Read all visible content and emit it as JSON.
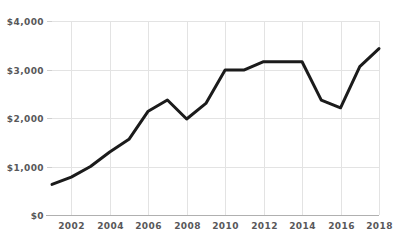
{
  "chart_data": {
    "type": "line",
    "title": "",
    "subtitle": "",
    "xlabel": "",
    "ylabel": "",
    "grid": true,
    "legend": false,
    "legend_position": "none",
    "line_color": "#1b1b1b",
    "grid_color": "#e3e3e3",
    "axis_color": "#b0b0b0",
    "tick_label_color": "#58585a",
    "background_color": "#ffffff",
    "xlim": [
      2001,
      2018
    ],
    "ylim": [
      0,
      4000
    ],
    "y_ticks": [
      0,
      1000,
      2000,
      3000,
      4000
    ],
    "y_tick_labels": [
      "$0",
      "$1,000",
      "$2,000",
      "$3,000",
      "$4,000"
    ],
    "x_ticks": [
      2002,
      2004,
      2006,
      2008,
      2010,
      2012,
      2014,
      2016,
      2018
    ],
    "x_tick_labels": [
      "2002",
      "2004",
      "2006",
      "2008",
      "2010",
      "2012",
      "2014",
      "2016",
      "2018"
    ],
    "x": [
      2001,
      2002,
      2003,
      2004,
      2005,
      2006,
      2007,
      2008,
      2009,
      2010,
      2011,
      2012,
      2013,
      2014,
      2015,
      2016,
      2017,
      2018
    ],
    "values": [
      630,
      780,
      1000,
      1300,
      1560,
      2140,
      2370,
      1980,
      2300,
      2990,
      2990,
      3160,
      3160,
      3160,
      2370,
      2210,
      3060,
      3430
    ],
    "series": [
      {
        "name": "Value",
        "values": [
          630,
          780,
          1000,
          1300,
          1560,
          2140,
          2370,
          1980,
          2300,
          2990,
          2990,
          3160,
          3160,
          3160,
          2370,
          2210,
          3060,
          3430
        ]
      }
    ]
  }
}
